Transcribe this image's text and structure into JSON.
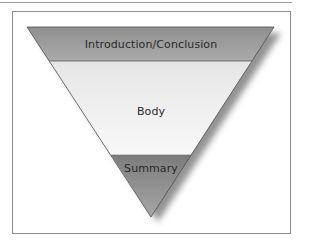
{
  "diagram": {
    "type": "inverted-triangle",
    "sections": [
      {
        "label": "Introduction/Conclusion",
        "fill": "#9c9c9c",
        "position": "top"
      },
      {
        "label": "Body",
        "fill": "#f2f2f2",
        "position": "middle"
      },
      {
        "label": "Summary",
        "fill": "#8e8e8e",
        "position": "bottom"
      }
    ],
    "colors": {
      "frame_border": "#8c8c8c",
      "outline": "#555555",
      "shadow": "#7a7a7a"
    }
  }
}
